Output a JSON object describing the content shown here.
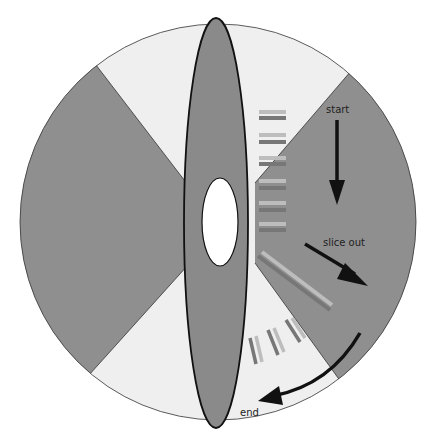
{
  "diagram": {
    "type": "rotating-disk-sectioning",
    "labels": {
      "start": "start",
      "slice_out": "slice out",
      "end": "end"
    },
    "colors": {
      "sector_dark": "#8f8f8f",
      "sector_light": "#efefef",
      "ellipse_fill": "#8a8a8a",
      "outline": "#111111",
      "hole": "#ffffff",
      "arrow": "#111111",
      "bar_light": "#bdbdbd",
      "bar_dark": "#777777"
    },
    "elements": [
      "outer circle with alternating dark/light wedges",
      "central vertical ellipse (blade/sample) with white oval hole",
      "stack of six horizontal double-bar slices",
      "one long diagonal slice",
      "three short tilted slices",
      "arrows: start (down), slice out (diagonal), end (curved)"
    ]
  }
}
